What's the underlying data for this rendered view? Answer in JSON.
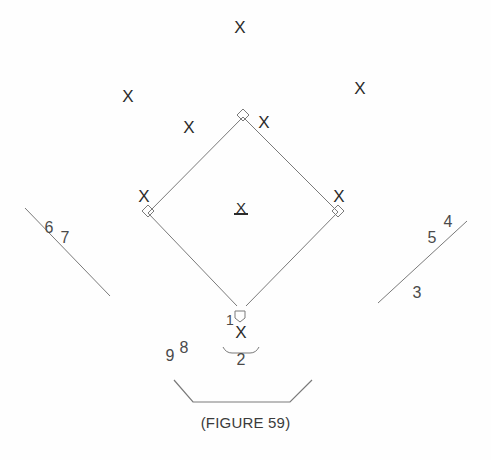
{
  "figure": {
    "caption": "(FIGURE 59)",
    "line_color": "#7a7a7a",
    "mark_color": "#2b2b2b",
    "label_color": "#4a4a4a",
    "background_color": "#fefefe"
  },
  "diamond": {
    "home": {
      "x": 240,
      "y": 310
    },
    "first": {
      "x": 338,
      "y": 212
    },
    "second": {
      "x": 243,
      "y": 117
    },
    "third": {
      "x": 148,
      "y": 213
    }
  },
  "bases": [
    {
      "name": "second-base",
      "x": 243,
      "y": 115
    },
    {
      "name": "third-base",
      "x": 148,
      "y": 211
    },
    {
      "name": "first-base",
      "x": 338,
      "y": 211
    },
    {
      "name": "home-plate",
      "x": 240,
      "y": 316
    }
  ],
  "players": [
    {
      "name": "center-fielder",
      "glyph": "X",
      "x": 240,
      "y": 27
    },
    {
      "name": "left-fielder",
      "glyph": "X",
      "x": 128,
      "y": 96
    },
    {
      "name": "right-fielder",
      "glyph": "X",
      "x": 360,
      "y": 88
    },
    {
      "name": "shortstop",
      "glyph": "X",
      "x": 189,
      "y": 127
    },
    {
      "name": "second-baseman",
      "glyph": "X",
      "x": 264,
      "y": 122
    },
    {
      "name": "third-baseman",
      "glyph": "X",
      "x": 144,
      "y": 196
    },
    {
      "name": "first-baseman",
      "glyph": "X",
      "x": 339,
      "y": 196
    },
    {
      "name": "pitcher",
      "glyph": "X",
      "x": 241,
      "y": 207
    },
    {
      "name": "catcher",
      "glyph": "X",
      "x": 241,
      "y": 332
    }
  ],
  "position_numbers": [
    {
      "name": "position-number-1-pitcher",
      "value": "1",
      "x": 230,
      "y": 320,
      "size": "small"
    },
    {
      "name": "position-number-2-catcher",
      "value": "2",
      "x": 241,
      "y": 360,
      "size": "normal"
    },
    {
      "name": "position-number-3-first-base",
      "value": "3",
      "x": 417,
      "y": 293,
      "size": "normal"
    },
    {
      "name": "position-number-4-second-base",
      "value": "4",
      "x": 448,
      "y": 222,
      "size": "normal"
    },
    {
      "name": "position-number-5-third-base",
      "value": "5",
      "x": 432,
      "y": 238,
      "size": "normal"
    },
    {
      "name": "position-number-6-shortstop",
      "value": "6",
      "x": 49,
      "y": 228,
      "size": "normal"
    },
    {
      "name": "position-number-7-left-field",
      "value": "7",
      "x": 65,
      "y": 238,
      "size": "normal"
    },
    {
      "name": "position-number-8-center-field",
      "value": "8",
      "x": 184,
      "y": 348,
      "size": "normal"
    },
    {
      "name": "position-number-9-right-field",
      "value": "9",
      "x": 170,
      "y": 356,
      "size": "normal"
    }
  ],
  "foul_lines": [
    {
      "name": "left-foul-line",
      "x1": 25,
      "y1": 208,
      "x2": 110,
      "y2": 296
    },
    {
      "name": "right-foul-line",
      "x1": 378,
      "y1": 303,
      "x2": 467,
      "y2": 221
    }
  ],
  "backstop": {
    "name": "backstop-line",
    "points": "174,380 193,402 290,402 312,380"
  },
  "umpire_arc": {
    "name": "umpire-arc",
    "path": "M 223,347 Q 226,353 232,353 L 250,353 Q 256,353 259,347"
  }
}
